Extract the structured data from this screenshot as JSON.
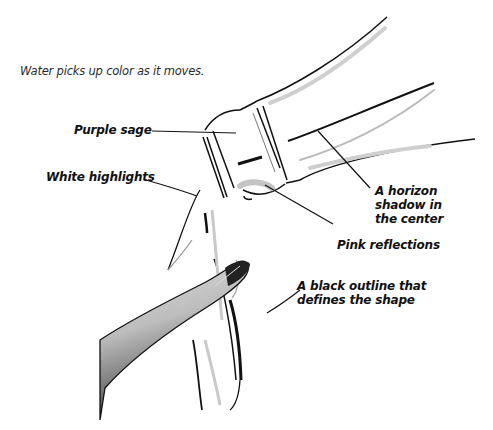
{
  "caption": "Water picks up color as it moves.",
  "labels": {
    "purple_sage": "Purple sage",
    "white_highlights": "White highlights",
    "horizon_line1": "A horizon",
    "horizon_line2": "shadow in",
    "horizon_line3": "the center",
    "pink_reflections": "Pink reflections",
    "outline_line1": "A black outline that",
    "outline_line2": "defines the shape"
  },
  "illustration": {
    "subject": "water pouring from a tilted glass bottle over a finger",
    "colors": {
      "outline": "#111111",
      "shading": "#9a9a9a",
      "light_gray": "#d6d6d6",
      "background": "#ffffff"
    }
  }
}
